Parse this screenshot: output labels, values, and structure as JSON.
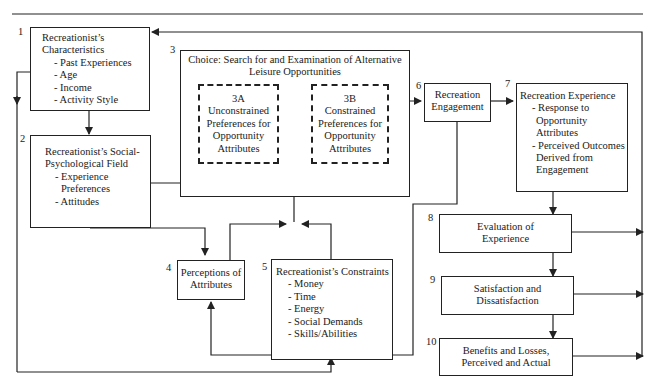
{
  "diagram": {
    "boxes": {
      "b1": {
        "num": "1",
        "title": "Recreationist's Characteristics",
        "title_l1": "Recreationist’s",
        "title_l2": "Characteristics",
        "items": [
          "- Past Experiences",
          "- Age",
          "- Income",
          "- Activity Style"
        ]
      },
      "b2": {
        "num": "2",
        "title_l1": "Recreationist’s Social-",
        "title_l2": "Psychological Field",
        "items": [
          "- Experience",
          "  Preferences",
          "- Attitudes"
        ]
      },
      "b3": {
        "num": "3",
        "title_l1": "Choice:  Search for and Examination of Alternative",
        "title_l2": "Leisure Opportunities"
      },
      "b3a": {
        "code": "3A",
        "lines": [
          "Unconstrained",
          "Preferences for",
          "Opportunity",
          "Attributes"
        ]
      },
      "b3b": {
        "code": "3B",
        "lines": [
          "Constrained",
          "Preferences for",
          "Opportunity",
          "Attributes"
        ]
      },
      "b4": {
        "num": "4",
        "lines": [
          "Perceptions of",
          "Attributes"
        ]
      },
      "b5": {
        "num": "5",
        "title": "Recreationist’s Constraints",
        "items": [
          "- Money",
          "- Time",
          "- Energy",
          "- Social Demands",
          "- Skills/Abilities"
        ]
      },
      "b6": {
        "num": "6",
        "lines": [
          "Recreation",
          "Engagement"
        ]
      },
      "b7": {
        "num": "7",
        "title": "Recreation Experience",
        "items": [
          "- Response to",
          "  Opportunity",
          "  Attributes",
          "- Perceived Outcomes",
          "  Derived from",
          "  Engagement"
        ]
      },
      "b8": {
        "num": "8",
        "lines": [
          "Evaluation of",
          "Experience"
        ]
      },
      "b9": {
        "num": "9",
        "lines": [
          "Satisfaction and",
          "Dissatisfaction"
        ]
      },
      "b10": {
        "num": "10",
        "lines": [
          "Benefits and Losses,",
          "Perceived and Actual"
        ]
      }
    },
    "colors": {
      "line": "#222222",
      "background": "#ffffff"
    }
  }
}
